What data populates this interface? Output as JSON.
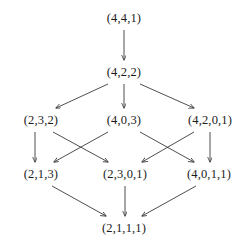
{
  "diagram": {
    "type": "directed-acyclic-graph",
    "background_color": "#ffffff",
    "text_color": "#1c1c1c",
    "edge_color": "#3a3a3a",
    "nodes": [
      {
        "id": "n0",
        "label": "(4,4,1)",
        "x": 124,
        "y": 18,
        "level": 0
      },
      {
        "id": "n1",
        "label": "(4,2,2)",
        "x": 124,
        "y": 72,
        "level": 1
      },
      {
        "id": "n2",
        "label": "(2,3,2)",
        "x": 41,
        "y": 120,
        "level": 2
      },
      {
        "id": "n3",
        "label": "(4,0,3)",
        "x": 124,
        "y": 120,
        "level": 2
      },
      {
        "id": "n4",
        "label": "(4,2,0,1)",
        "x": 210,
        "y": 120,
        "level": 2
      },
      {
        "id": "n5",
        "label": "(2,1,3)",
        "x": 41,
        "y": 174,
        "level": 3
      },
      {
        "id": "n6",
        "label": "(2,3,0,1)",
        "x": 125,
        "y": 174,
        "level": 3
      },
      {
        "id": "n7",
        "label": "(4,0,1,1)",
        "x": 209,
        "y": 174,
        "level": 3
      },
      {
        "id": "n8",
        "label": "(2,1,1,1)",
        "x": 124,
        "y": 228,
        "level": 4
      }
    ],
    "edges": [
      {
        "from": "n0",
        "to": "n1",
        "x1": 124,
        "y1": 30,
        "x2": 124,
        "y2": 60
      },
      {
        "from": "n1",
        "to": "n2",
        "x1": 108,
        "y1": 84,
        "x2": 56,
        "y2": 108
      },
      {
        "from": "n1",
        "to": "n3",
        "x1": 124,
        "y1": 84,
        "x2": 124,
        "y2": 108
      },
      {
        "from": "n1",
        "to": "n4",
        "x1": 140,
        "y1": 84,
        "x2": 194,
        "y2": 108
      },
      {
        "from": "n2",
        "to": "n5",
        "x1": 35,
        "y1": 132,
        "x2": 35,
        "y2": 162
      },
      {
        "from": "n2",
        "to": "n6",
        "x1": 53,
        "y1": 132,
        "x2": 108,
        "y2": 162
      },
      {
        "from": "n3",
        "to": "n5",
        "x1": 108,
        "y1": 132,
        "x2": 54,
        "y2": 162
      },
      {
        "from": "n3",
        "to": "n7",
        "x1": 140,
        "y1": 132,
        "x2": 194,
        "y2": 162
      },
      {
        "from": "n4",
        "to": "n6",
        "x1": 194,
        "y1": 132,
        "x2": 142,
        "y2": 162
      },
      {
        "from": "n4",
        "to": "n7",
        "x1": 210,
        "y1": 132,
        "x2": 210,
        "y2": 162
      },
      {
        "from": "n5",
        "to": "n8",
        "x1": 52,
        "y1": 186,
        "x2": 106,
        "y2": 216
      },
      {
        "from": "n6",
        "to": "n8",
        "x1": 125,
        "y1": 186,
        "x2": 125,
        "y2": 216
      },
      {
        "from": "n7",
        "to": "n8",
        "x1": 196,
        "y1": 186,
        "x2": 142,
        "y2": 216
      }
    ]
  }
}
